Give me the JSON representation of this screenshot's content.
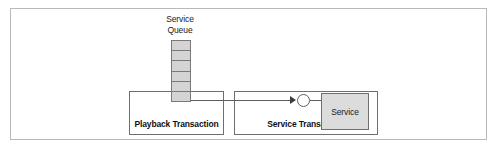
{
  "diagram": {
    "title": "",
    "queue": {
      "label": "Service\nQueue",
      "cell_count": 6,
      "cells": [
        "",
        "",
        "",
        "",
        "",
        ""
      ],
      "fill_color": "#d4d4d4",
      "border_color": "#7a7a7a"
    },
    "playback_transaction": {
      "label": "Playback Transaction",
      "border_color": "#6f6f6f"
    },
    "service_transaction": {
      "label": "Service Transaction",
      "border_color": "#6f6f6f"
    },
    "service_component": {
      "label": "Service",
      "fill_color": "#dcdcdc",
      "border_color": "#6f6f6f"
    },
    "connector": {
      "arrow_direction": "right",
      "junction_shape": "circle",
      "line_color": "#5e5e5e"
    },
    "frame": {
      "border_color": "#b9b9b9"
    }
  }
}
